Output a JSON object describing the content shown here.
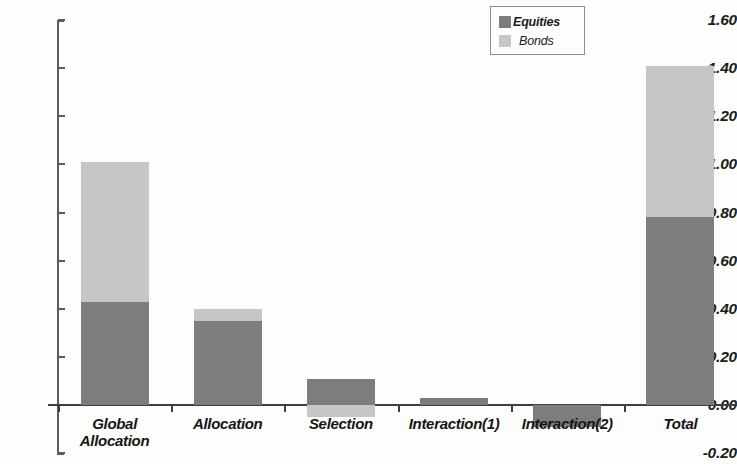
{
  "chart_data": {
    "type": "bar",
    "stacked": true,
    "title": "",
    "xlabel": "",
    "ylabel": "",
    "categories": [
      "Global Allocation",
      "Allocation",
      "Selection",
      "Interaction(1)",
      "Interaction(2)",
      "Total"
    ],
    "series": [
      {
        "name": "Equities",
        "color": "#7d7d7d",
        "values": [
          0.43,
          0.35,
          0.11,
          0.03,
          -0.09,
          0.78
        ]
      },
      {
        "name": "Bonds",
        "color": "#c6c6c6",
        "values": [
          0.58,
          0.05,
          -0.05,
          0.0,
          0.0,
          0.63
        ]
      }
    ],
    "totals": [
      1.01,
      0.4,
      0.06,
      0.03,
      -0.09,
      1.41
    ],
    "ylim": [
      -0.2,
      1.6
    ],
    "ytick_step": 0.2,
    "ytick_labels": [
      "1.60",
      "1.40",
      "1.20",
      "1.00",
      "0.80",
      "0.60",
      "0.40",
      "0.20",
      "0.00",
      "-0.20"
    ],
    "ytick_values": [
      1.6,
      1.4,
      1.2,
      1.0,
      0.8,
      0.6,
      0.4,
      0.2,
      0.0,
      -0.2
    ],
    "grid": false,
    "legend_position": "top-right",
    "legend_entries": [
      {
        "label": "Equities",
        "color": "#7d7d7d"
      },
      {
        "label": "Bonds",
        "color": "#c6c6c6"
      }
    ]
  },
  "axis": {
    "y_labels": [
      "1.60",
      "1.40",
      "1.20",
      "1.00",
      "0.80",
      "0.60",
      "0.40",
      "0.20",
      "0.00",
      "-0.20"
    ],
    "x_labels": [
      "Global Allocation",
      "Allocation",
      "Selection",
      "Interaction(1)",
      "Interaction(2)",
      "Total"
    ]
  },
  "legend": {
    "equities_label": "Equities",
    "bonds_label": "Bonds"
  },
  "colors": {
    "equities": "#7d7d7d",
    "bonds": "#c6c6c6",
    "axis": "#3f3f3f",
    "background": "#fdfdfc"
  }
}
